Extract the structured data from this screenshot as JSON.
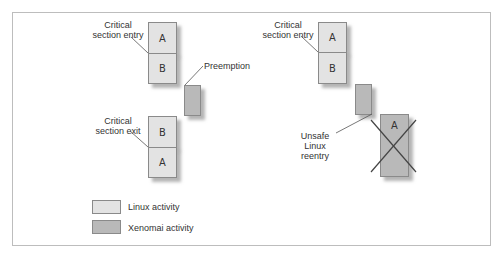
{
  "diagram": {
    "left_scenario": {
      "entry_label": [
        "Critical",
        "section entry"
      ],
      "exit_label": [
        "Critical",
        "section exit"
      ],
      "preemption_label": "Preemption",
      "top_stack": [
        "A",
        "B"
      ],
      "bottom_stack": [
        "B",
        "A"
      ]
    },
    "right_scenario": {
      "entry_label": [
        "Critical",
        "section entry"
      ],
      "reentry_label": [
        "Unsafe Linux",
        "reentry"
      ],
      "top_stack": [
        "A",
        "B"
      ],
      "crossed_box": "A"
    },
    "legend": {
      "linux": "Linux activity",
      "xenomai": "Xenomai activity"
    },
    "colors": {
      "linux": "#e3e3e3",
      "xenomai": "#b9b9b9",
      "border": "#8a8a8a"
    }
  }
}
